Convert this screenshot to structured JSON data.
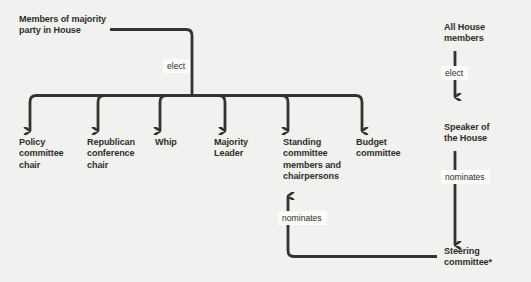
{
  "diagram": {
    "background_color": "#f1f1ef",
    "line_color": "#33332f",
    "text_color": "#2e2e2b",
    "label_box_color": "#fbfbfa",
    "nodes": {
      "majority_party": "Members of majority\nparty in House",
      "policy_committee_chair": "Policy\ncommittee\nchair",
      "republican_conference_chair": "Republican\nconference\nchair",
      "whip": "Whip",
      "majority_leader": "Majority\nLeader",
      "standing_committee": "Standing\ncommittee\nmembers and\nchairpersons",
      "budget_committee": "Budget\ncommittee",
      "all_house_members": "All House\nmembers",
      "speaker_of_the_house": "Speaker of\nthe House",
      "steering_committee": "Steering\ncommittee*"
    },
    "edge_labels": {
      "majority_party_elects": "elect",
      "all_house_elects": "elect",
      "speaker_nominates": "nominates",
      "steering_nominates": "nominates"
    }
  }
}
